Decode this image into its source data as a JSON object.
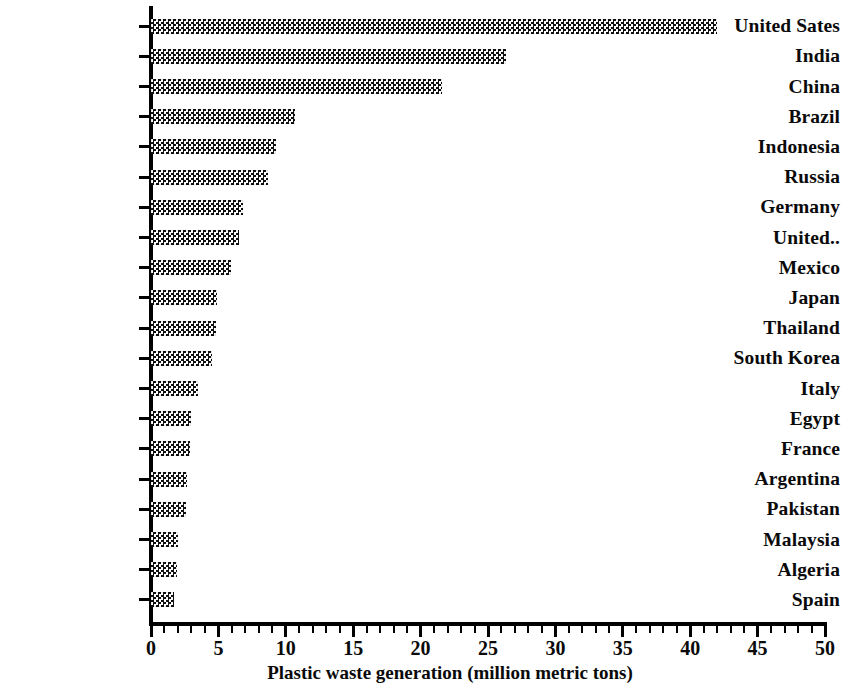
{
  "chart_data": {
    "type": "bar",
    "orientation": "horizontal",
    "title": "",
    "xlabel": "Plastic waste generation (million metric tons)",
    "ylabel": "",
    "xlim": [
      0,
      50
    ],
    "xticks": [
      0,
      5,
      10,
      15,
      20,
      25,
      30,
      35,
      40,
      45,
      50
    ],
    "xtick_labels": [
      "0",
      "5",
      "10",
      "15",
      "20",
      "25",
      "30",
      "35",
      "40",
      "45",
      "50"
    ],
    "minor_tick_step": 1,
    "grid": false,
    "legend": null,
    "bar_fill": "checkerboard-dot-pattern",
    "bar_color": "#101010",
    "categories": [
      "United Sates",
      "India",
      "China",
      "Brazil",
      "Indonesia",
      "Russia",
      "Germany",
      "United..",
      "Mexico",
      "Japan",
      "Thailand",
      "South Korea",
      "Italy",
      "Egypt",
      "France",
      "Argentina",
      "Pakistan",
      "Malaysia",
      "Algeria",
      "Spain"
    ],
    "values": [
      42.0,
      26.3,
      21.6,
      10.7,
      9.3,
      8.7,
      6.8,
      6.5,
      5.9,
      4.9,
      4.8,
      4.5,
      3.5,
      3.0,
      2.9,
      2.7,
      2.6,
      2.0,
      1.9,
      1.7
    ]
  }
}
